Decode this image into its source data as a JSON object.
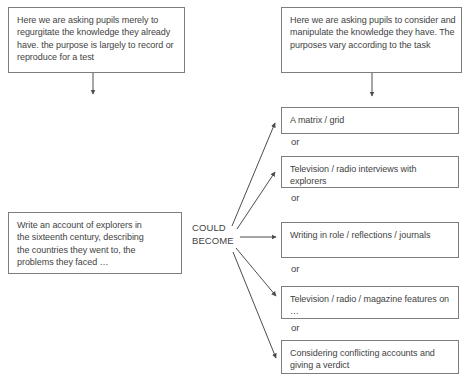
{
  "boxes": {
    "top_left": {
      "text": "Here we are asking pupils merely to regurgitate the knowledge they already have. the purpose is largely to record or reproduce for a test"
    },
    "top_right": {
      "text": "Here we are asking pupils to consider and manipulate the knowledge they have. The purposes vary according to the task"
    },
    "task": {
      "text": "Write an account of explorers in the sixteenth century, describing the countries they went to, the problems they faced …"
    }
  },
  "connector": {
    "label": "COULD BECOME",
    "or_label": "or"
  },
  "options": [
    {
      "label": "A matrix / grid"
    },
    {
      "label": "Television / radio interviews with explorers"
    },
    {
      "label": "Writing in role / reflections / journals"
    },
    {
      "label": "Television / radio / magazine features on …"
    },
    {
      "label": "Considering conflicting accounts and giving a verdict"
    }
  ],
  "colors": {
    "background": "#ffffff",
    "box_border": "#7d7d7d",
    "text": "#3f3f3f",
    "arrow": "#4c4c4c"
  }
}
